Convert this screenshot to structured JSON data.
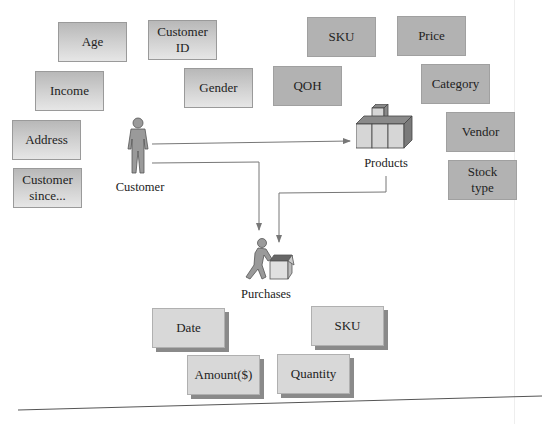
{
  "customer": {
    "label": "Customer",
    "attributes": [
      "Age",
      "Customer ID",
      "Income",
      "Gender",
      "Address",
      "Customer since..."
    ]
  },
  "products": {
    "label": "Products",
    "attributes": [
      "SKU",
      "Price",
      "QOH",
      "Category",
      "Vendor",
      "Stock type"
    ]
  },
  "purchases": {
    "label": "Purchases",
    "attributes": [
      "Date",
      "SKU",
      "Amount($)",
      "Quantity"
    ]
  },
  "icons": {
    "customer": "person-icon",
    "products": "stacked-boxes-icon",
    "purchases": "person-with-box-icon"
  },
  "colors": {
    "customer_box": "#c8c8c8",
    "product_box": "#b2b2b2",
    "purchase_box": "#d8d8d8",
    "arrow": "#777777"
  }
}
